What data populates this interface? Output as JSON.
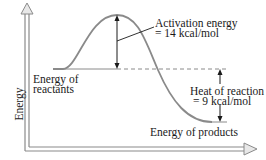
{
  "diagram": {
    "type": "energy-profile",
    "axis": {
      "y_label": "Energy"
    },
    "labels": {
      "activation_line1": "Activation energy",
      "activation_line2": "= 14 kcal/mol",
      "reactants_line1": "Energy of",
      "reactants_line2": "reactants",
      "heat_line1": "Heat of reaction",
      "heat_line2": "= 9 kcal/mol",
      "products": "Energy of products"
    },
    "values": {
      "activation_energy_kcal_per_mol": 14,
      "heat_of_reaction_kcal_per_mol": 9
    },
    "colors": {
      "curve": "#8a8a8a",
      "axis": "#8a8a8a",
      "text": "#1a1a1a"
    }
  }
}
